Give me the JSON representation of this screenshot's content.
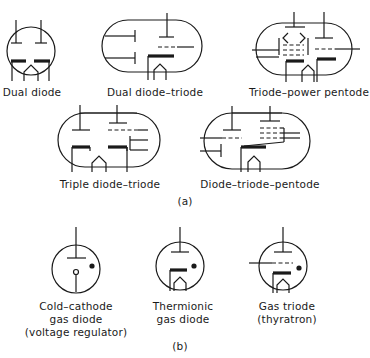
{
  "figure": {
    "part_a": {
      "label": "(a)",
      "tubes": [
        {
          "name": "Dual diode"
        },
        {
          "name": "Dual diode–triode"
        },
        {
          "name": "Triode–power pentode"
        },
        {
          "name": "Triple diode–triode"
        },
        {
          "name": "Diode–triode–pentode"
        }
      ]
    },
    "part_b": {
      "label": "(b)",
      "tubes": [
        {
          "line1": "Cold–cathode",
          "line2": "gas diode",
          "line3": "(voltage regulator)"
        },
        {
          "line1": "Thermionic",
          "line2": "gas diode"
        },
        {
          "line1": "Gas triode",
          "line2": "(thyratron)"
        }
      ]
    }
  }
}
